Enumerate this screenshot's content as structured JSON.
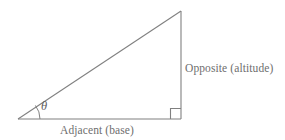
{
  "figure": {
    "background_color": "#ffffff",
    "stroke_color": "#808080",
    "text_color": "#6e6e6e",
    "labels": {
      "opposite": "Opposite (altitude)",
      "adjacent": "Adjacent (base)",
      "angle": "θ"
    },
    "geometry": {
      "left_vertex": [
        18,
        119
      ],
      "apex_vertex": [
        181,
        11
      ],
      "right_angle_vertex": [
        181,
        119
      ],
      "angle_arc_radius": 22,
      "right_angle_marker_size": 10
    }
  }
}
